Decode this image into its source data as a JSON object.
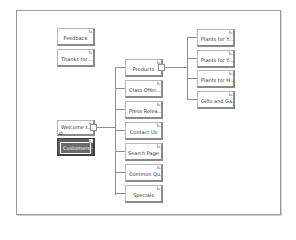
{
  "diagram": {
    "orphans": [
      {
        "label": "Feedback"
      },
      {
        "label": "Thanks for ..."
      }
    ],
    "root": {
      "label": "Welcome t...",
      "home_icon": "house-icon"
    },
    "selected": {
      "label": "Customers -..."
    },
    "level1": [
      {
        "label": "Products"
      },
      {
        "label": "Class Offer..."
      },
      {
        "label": "Press Relea..."
      },
      {
        "label": "Contact Us"
      },
      {
        "label": "Search Page"
      },
      {
        "label": "Common Qu..."
      },
      {
        "label": "Specials"
      }
    ],
    "level2": [
      {
        "label": "Plants for Y..."
      },
      {
        "label": "Plants for Y..."
      },
      {
        "label": "Plants for H..."
      },
      {
        "label": "Gifts and Ga..."
      }
    ]
  }
}
